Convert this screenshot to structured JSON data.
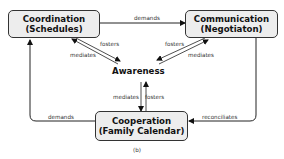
{
  "nodes": {
    "coordination": {
      "line1": "Coordination",
      "line2": "(Schedules)"
    },
    "communication": {
      "line1": "Communication",
      "line2": "(Negotiaton)"
    },
    "cooperation": {
      "line1": "Cooperation",
      "line2": "(Family Calendar)"
    },
    "awareness": {
      "label": "Awareness"
    }
  },
  "edges": {
    "coord_to_comm": "demands",
    "coord_fosters": "fosters",
    "coord_mediates": "mediates",
    "comm_fosters": "fosters",
    "comm_mediates": "mediates",
    "coop_mediates": "mediates",
    "coop_fosters": "fosters",
    "coop_to_coord": "demands",
    "comm_to_coop": "reconciliates"
  },
  "caption": "(b)"
}
